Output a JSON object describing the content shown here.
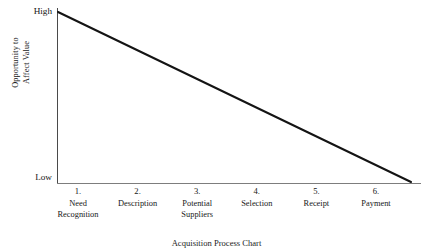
{
  "chart_data": {
    "type": "line",
    "title": "Acquisition Process Chart",
    "xlabel": "",
    "ylabel": "Opportunity to Affect Value",
    "ylabel_lines": [
      "Opportunity to",
      "Affect Value"
    ],
    "y_axis_top_label": "High",
    "y_axis_bottom_label": "Low",
    "ylim": [
      "Low",
      "High"
    ],
    "grid": false,
    "legend": "none",
    "categories": [
      "1. Need Recognition",
      "2. Description",
      "3. Potential Suppliers",
      "4. Selection",
      "5. Receipt",
      "6. Payment"
    ],
    "ticks": [
      {
        "number": "1.",
        "lines": [
          "Need",
          "Recognition"
        ]
      },
      {
        "number": "2.",
        "lines": [
          "Description"
        ]
      },
      {
        "number": "3.",
        "lines": [
          "Potential",
          "Suppliers"
        ]
      },
      {
        "number": "4.",
        "lines": [
          "Selection"
        ]
      },
      {
        "number": "5.",
        "lines": [
          "Receipt"
        ]
      },
      {
        "number": "6.",
        "lines": [
          "Payment"
        ]
      }
    ],
    "series": [
      {
        "name": "Opportunity to Affect Value",
        "values": [
          100,
          80,
          60,
          40,
          20,
          0
        ],
        "color": "#141414"
      }
    ],
    "colors": {
      "line": "#141414",
      "y_axis": "#4a4a4a",
      "x_axis": "#7d7d7d",
      "text": "#171717",
      "background": "#ffffff"
    }
  }
}
